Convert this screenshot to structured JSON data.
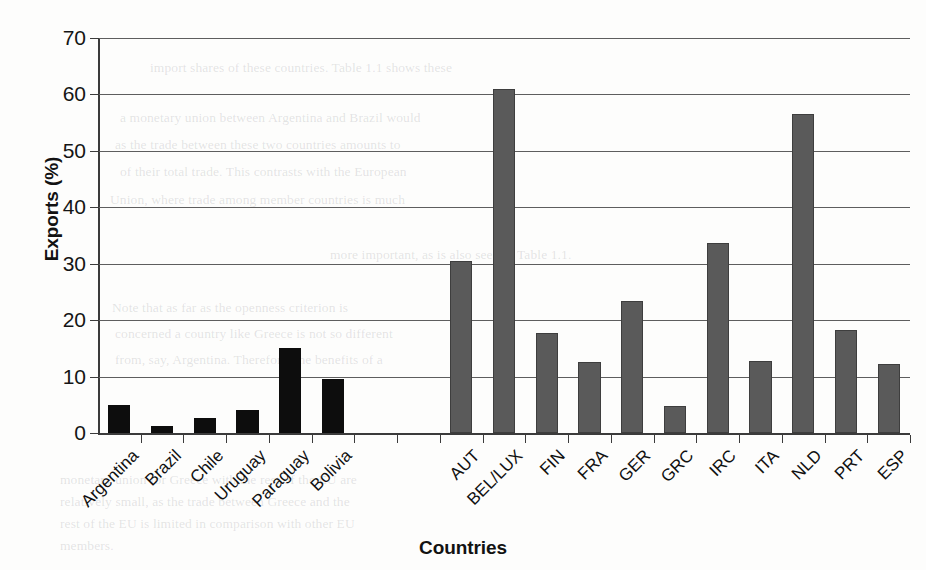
{
  "page": {
    "running_header": "PART I  COSTS AND BENEFITS OF MONETARY UNION",
    "background_text_lines": [
      "import shares of these countries. Table 1.1 shows these",
      "a monetary union between Argentina and Brazil would",
      "as the trade between these two countries amounts to",
      "of their total trade. This contrasts with the European",
      "Union, where trade among member countries is much",
      "more important, as is also seen in Table 1.1.",
      "Note that as far as the openness criterion is",
      "concerned a country like Greece is not so different",
      "from, say, Argentina. Therefore, the benefits of a",
      "monetary union for Greece with the rest of the EU are",
      "relatively small, as the trade between Greece and the",
      "rest of the EU is limited in comparison with other EU",
      "members."
    ]
  },
  "chart_data": {
    "type": "bar",
    "title": "",
    "xlabel": "Countries",
    "ylabel": "Exports (%)",
    "ylim": [
      0,
      70
    ],
    "ytick_step": 10,
    "yticks": [
      0,
      10,
      20,
      30,
      40,
      50,
      60,
      70
    ],
    "grid": true,
    "legend": "none",
    "categories": [
      "Argentina",
      "Brazil",
      "Chile",
      "Uruguay",
      "Paraguay",
      "Bolivia",
      "",
      "",
      "AUT",
      "BEL/LUX",
      "FIN",
      "FRA",
      "GER",
      "GRC",
      "IRC",
      "ITA",
      "NLD",
      "PRT",
      "ESP"
    ],
    "values": [
      4.9,
      1.2,
      2.6,
      4.1,
      15.0,
      9.5,
      null,
      null,
      30.4,
      60.9,
      17.7,
      12.5,
      23.4,
      4.7,
      33.6,
      12.8,
      56.6,
      18.3,
      12.2
    ],
    "group_colors": [
      "#0d0d0d",
      "#0d0d0d",
      "#0d0d0d",
      "#0d0d0d",
      "#0d0d0d",
      "#0d0d0d",
      null,
      null,
      "#5a5a5a",
      "#5a5a5a",
      "#5a5a5a",
      "#5a5a5a",
      "#5a5a5a",
      "#5a5a5a",
      "#5a5a5a",
      "#5a5a5a",
      "#5a5a5a",
      "#5a5a5a",
      "#5a5a5a"
    ],
    "groups": [
      {
        "name": "Mercosur / Latin America",
        "color": "#0d0d0d"
      },
      {
        "name": "European Union",
        "color": "#5a5a5a"
      }
    ]
  },
  "colors": {
    "dark_bar": "#0d0d0d",
    "gray_bar": "#5a5a5a",
    "axis": "#3b3b3b",
    "gridline": "#5e5e5e",
    "page_background": "#fdfdfc",
    "text": "#121212"
  }
}
